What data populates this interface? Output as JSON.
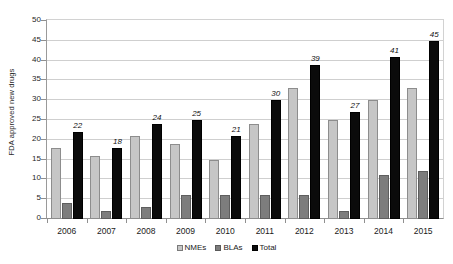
{
  "chart_data": {
    "type": "bar",
    "title": "",
    "xlabel": "",
    "ylabel": "FDA approved new drugs",
    "ylim": [
      0,
      50
    ],
    "ytick_step": 5,
    "yticks": [
      50,
      45,
      40,
      35,
      30,
      25,
      20,
      15,
      10,
      5,
      0
    ],
    "grid": true,
    "legend_position": "bottom",
    "categories": [
      "2006",
      "2007",
      "2008",
      "2009",
      "2010",
      "2011",
      "2012",
      "2013",
      "2014",
      "2015"
    ],
    "series": [
      {
        "name": "NMEs",
        "color": "#c6c6c6",
        "values": [
          18,
          16,
          21,
          19,
          15,
          24,
          33,
          25,
          30,
          33
        ],
        "labels": [
          "",
          "",
          "",
          "",
          "",
          "",
          "",
          "",
          "",
          ""
        ]
      },
      {
        "name": "BLAs",
        "color": "#7d7d7d",
        "values": [
          4,
          2,
          3,
          6,
          6,
          6,
          6,
          2,
          11,
          12
        ],
        "labels": [
          "",
          "",
          "",
          "",
          "",
          "",
          "",
          "",
          "",
          ""
        ]
      },
      {
        "name": "Total",
        "color": "#0b0b0b",
        "values": [
          22,
          18,
          24,
          25,
          21,
          30,
          39,
          27,
          41,
          45
        ],
        "labels": [
          "22",
          "18",
          "24",
          "25",
          "21",
          "30",
          "39",
          "27",
          "41",
          "45"
        ]
      }
    ]
  },
  "legend": {
    "items": [
      {
        "label": "NMEs",
        "swatch": "nmes-swatch"
      },
      {
        "label": "BLAs",
        "swatch": "blas-swatch"
      },
      {
        "label": "Total",
        "swatch": "total-swatch"
      }
    ]
  }
}
